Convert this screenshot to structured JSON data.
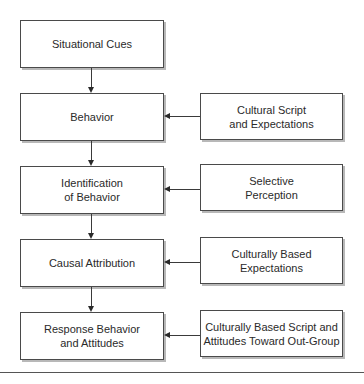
{
  "diagram": {
    "main_flow": [
      {
        "id": "situational-cues",
        "label": "Situational Cues"
      },
      {
        "id": "behavior",
        "label": "Behavior"
      },
      {
        "id": "identification-of-behavior",
        "label": "Identification\nof Behavior"
      },
      {
        "id": "causal-attribution",
        "label": "Causal Attribution"
      },
      {
        "id": "response-behavior-and-attitudes",
        "label": "Response Behavior\nand Attitudes"
      }
    ],
    "influences": [
      {
        "id": "cultural-script",
        "label": "Cultural Script\nand Expectations",
        "target": "behavior"
      },
      {
        "id": "selective-perception",
        "label": "Selective\nPerception",
        "target": "identification-of-behavior"
      },
      {
        "id": "culturally-based-expectations",
        "label": "Culturally Based\nExpectations",
        "target": "causal-attribution"
      },
      {
        "id": "culturally-based-script-attitudes",
        "label": "Culturally Based Script and\nAttitudes Toward Out-Group",
        "target": "response-behavior-and-attitudes"
      }
    ],
    "colors": {
      "border": "#4a4a4a",
      "shadow": "#b8b8b8",
      "arrow": "#2a2a2a",
      "text": "#2a2a2a"
    }
  }
}
